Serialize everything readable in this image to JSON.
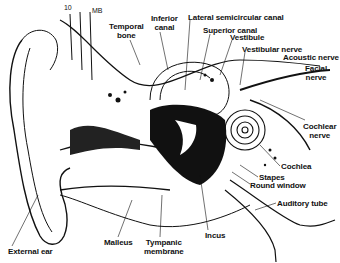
{
  "diagram": {
    "corner_marks": [
      "10",
      "MB"
    ],
    "labels": [
      {
        "id": "temporal-bone",
        "text_lines": [
          "Temporal",
          "bone"
        ],
        "x": 109,
        "y": 22
      },
      {
        "id": "inferior-canal",
        "text_lines": [
          "Inferior",
          "canal"
        ],
        "x": 151,
        "y": 14
      },
      {
        "id": "lateral-semicircular-canal",
        "text_lines": [
          "Lateral semicircular canal"
        ],
        "x": 188,
        "y": 13
      },
      {
        "id": "superior-canal",
        "text_lines": [
          "Superior canal"
        ],
        "x": 203,
        "y": 26
      },
      {
        "id": "vestibule",
        "text_lines": [
          "Vestibule"
        ],
        "x": 230,
        "y": 33
      },
      {
        "id": "vestibular-nerve",
        "text_lines": [
          "Vestibular nerve"
        ],
        "x": 242,
        "y": 45
      },
      {
        "id": "acoustic-nerve",
        "text_lines": [
          "Acoustic nerve"
        ],
        "x": 283,
        "y": 53
      },
      {
        "id": "facial-nerve",
        "text_lines": [
          "Facial",
          "nerve"
        ],
        "x": 305,
        "y": 64
      },
      {
        "id": "cochlear-nerve",
        "text_lines": [
          "Cochlear",
          "nerve"
        ],
        "x": 303,
        "y": 122
      },
      {
        "id": "cochlea",
        "text_lines": [
          "Cochlea"
        ],
        "x": 281,
        "y": 162
      },
      {
        "id": "stapes",
        "text_lines": [
          "Stapes"
        ],
        "x": 259,
        "y": 173
      },
      {
        "id": "round-window",
        "text_lines": [
          "Round window"
        ],
        "x": 250,
        "y": 181
      },
      {
        "id": "auditory-tube",
        "text_lines": [
          "Auditory tube"
        ],
        "x": 277,
        "y": 199
      },
      {
        "id": "external-ear",
        "text_lines": [
          "External ear"
        ],
        "x": 8,
        "y": 247
      },
      {
        "id": "malleus",
        "text_lines": [
          "Malleus"
        ],
        "x": 104,
        "y": 238
      },
      {
        "id": "tympanic-membrane",
        "text_lines": [
          "Tympanic",
          "membrane"
        ],
        "x": 144,
        "y": 238
      },
      {
        "id": "incus",
        "text_lines": [
          "Incus"
        ],
        "x": 205,
        "y": 231
      }
    ]
  },
  "colors": {
    "ink": "#111111",
    "paper": "#ffffff"
  }
}
